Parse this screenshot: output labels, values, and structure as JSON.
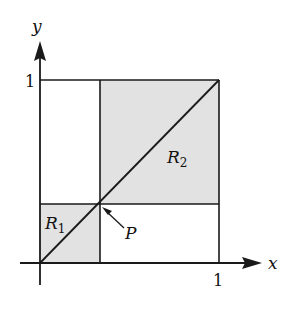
{
  "diagram": {
    "axes": {
      "x_label": "x",
      "y_label": "y",
      "x_tick": "1",
      "y_tick": "1"
    },
    "regions": [
      {
        "name": "R",
        "subscript": "1",
        "description": "lower-left shaded square from origin to P"
      },
      {
        "name": "R",
        "subscript": "2",
        "description": "upper-right shaded square from P to (1,1)"
      }
    ],
    "point": {
      "label": "P",
      "description": "point on the diagonal y = x"
    },
    "colors": {
      "shade": "#e2e2e2",
      "line": "#1a1a1a",
      "background": "#ffffff"
    }
  }
}
